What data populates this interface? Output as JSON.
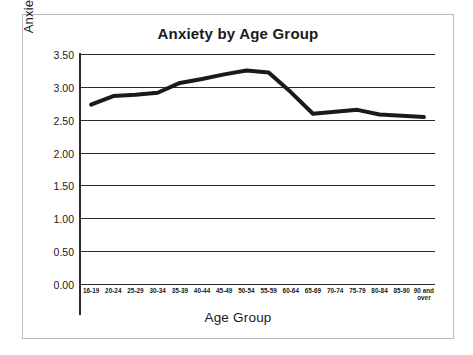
{
  "chart_data": {
    "type": "line",
    "title": "Anxiety by Age Group",
    "xlabel": "Age Group",
    "ylabel": "Anxiety Rating",
    "categories": [
      "16-19",
      "20-24",
      "25-29",
      "30-34",
      "35-39",
      "40-44",
      "45-49",
      "50-54",
      "55-59",
      "60-64",
      "65-69",
      "70-74",
      "75-79",
      "80-84",
      "85-90",
      "90 and over"
    ],
    "values": [
      2.73,
      2.86,
      2.88,
      2.91,
      3.06,
      3.12,
      3.19,
      3.25,
      3.22,
      2.92,
      2.59,
      2.62,
      2.65,
      2.58,
      2.56,
      2.54
    ],
    "series": [
      {
        "name": "Anxiety Rating",
        "values": [
          2.73,
          2.86,
          2.88,
          2.91,
          3.06,
          3.12,
          3.19,
          3.25,
          3.22,
          2.92,
          2.59,
          2.62,
          2.65,
          2.58,
          2.56,
          2.54
        ]
      }
    ],
    "ylim": [
      0.0,
      3.5
    ],
    "ytick_labels": [
      "0.00",
      "0.50",
      "1.00",
      "1.50",
      "2.00",
      "2.50",
      "3.00",
      "3.50"
    ],
    "ytick_values": [
      0.0,
      0.5,
      1.0,
      1.5,
      2.0,
      2.5,
      3.0,
      3.5
    ],
    "grid": true,
    "legend": "none",
    "line_color": "#1a1a1a",
    "line_width": 4,
    "frame_color": "#b9b9b9",
    "axis_color": "#2b2b2b",
    "background": "#ffffff"
  }
}
